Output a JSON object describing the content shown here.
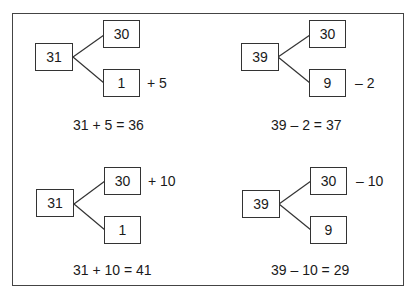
{
  "panels": [
    {
      "root": "31",
      "top": "30",
      "bottom": "1",
      "operation": "+ 5",
      "operation_on": "bottom",
      "equation": "31 + 5 = 36"
    },
    {
      "root": "39",
      "top": "30",
      "bottom": "9",
      "operation": "– 2",
      "operation_on": "bottom",
      "equation": "39 – 2 = 37"
    },
    {
      "root": "31",
      "top": "30",
      "bottom": "1",
      "operation": "+ 10",
      "operation_on": "top",
      "equation": "31 + 10 = 41"
    },
    {
      "root": "39",
      "top": "30",
      "bottom": "9",
      "operation": "– 10",
      "operation_on": "top",
      "equation": "39 – 10 = 29"
    }
  ]
}
